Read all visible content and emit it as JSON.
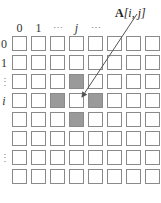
{
  "diagram": {
    "title_label": "A[i, j]",
    "title_name": "A",
    "title_index": "[i, j]",
    "column_labels": [
      "0",
      "1",
      "⋯",
      "j",
      "⋯"
    ],
    "row_labels": [
      "0",
      "1",
      "⋮",
      "i",
      "",
      "⋮",
      "",
      ""
    ],
    "grid": {
      "rows": 8,
      "cols": 8
    },
    "shaded_cells": [
      [
        2,
        3
      ],
      [
        3,
        2
      ],
      [
        3,
        4
      ],
      [
        4,
        3
      ]
    ],
    "target_cell": [
      3,
      3
    ],
    "colors": {
      "cell_border": "#8a8a8a",
      "shaded_fill": "#9a9a9a",
      "arrow": "#555555"
    }
  }
}
